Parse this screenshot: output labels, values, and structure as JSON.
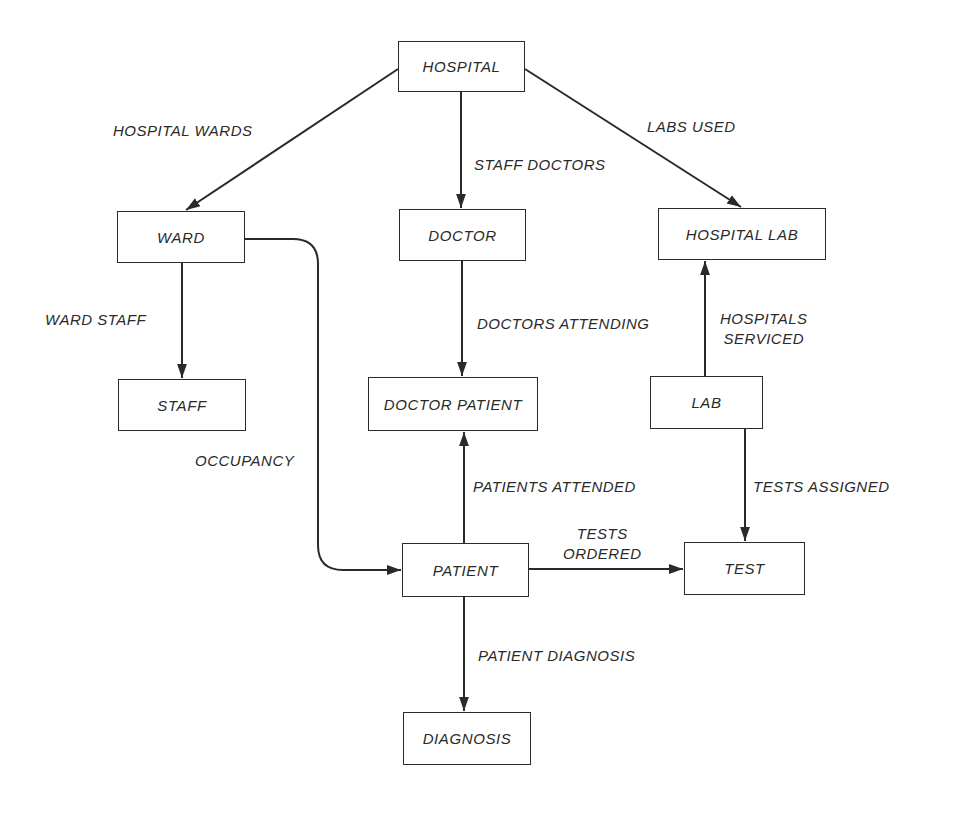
{
  "diagram": {
    "type": "data-structure-diagram",
    "nodes": {
      "hospital": "HOSPITAL",
      "ward": "WARD",
      "doctor": "DOCTOR",
      "hospital_lab": "HOSPITAL LAB",
      "staff": "STAFF",
      "doctor_patient": "DOCTOR PATIENT",
      "lab": "LAB",
      "patient": "PATIENT",
      "test": "TEST",
      "diagnosis": "DIAGNOSIS"
    },
    "edges": {
      "hospital_wards": "HOSPITAL WARDS",
      "staff_doctors": "STAFF DOCTORS",
      "labs_used": "LABS USED",
      "ward_staff": "WARD STAFF",
      "doctors_attending": "DOCTORS ATTENDING",
      "hospitals_serviced_line1": "HOSPITALS",
      "hospitals_serviced_line2": "SERVICED",
      "occupancy": "OCCUPANCY",
      "patients_attended": "PATIENTS ATTENDED",
      "tests_assigned": "TESTS ASSIGNED",
      "tests_ordered_line1": "TESTS",
      "tests_ordered_line2": "ORDERED",
      "patient_diagnosis": "PATIENT DIAGNOSIS"
    },
    "relationships": [
      {
        "from": "HOSPITAL",
        "to": "WARD",
        "label": "HOSPITAL WARDS"
      },
      {
        "from": "HOSPITAL",
        "to": "DOCTOR",
        "label": "STAFF DOCTORS"
      },
      {
        "from": "HOSPITAL",
        "to": "HOSPITAL LAB",
        "label": "LABS USED"
      },
      {
        "from": "WARD",
        "to": "STAFF",
        "label": "WARD STAFF"
      },
      {
        "from": "WARD",
        "to": "PATIENT",
        "label": "OCCUPANCY"
      },
      {
        "from": "DOCTOR",
        "to": "DOCTOR PATIENT",
        "label": "DOCTORS ATTENDING"
      },
      {
        "from": "PATIENT",
        "to": "DOCTOR PATIENT",
        "label": "PATIENTS ATTENDED"
      },
      {
        "from": "LAB",
        "to": "HOSPITAL LAB",
        "label": "HOSPITALS SERVICED"
      },
      {
        "from": "LAB",
        "to": "TEST",
        "label": "TESTS ASSIGNED"
      },
      {
        "from": "PATIENT",
        "to": "TEST",
        "label": "TESTS ORDERED"
      },
      {
        "from": "PATIENT",
        "to": "DIAGNOSIS",
        "label": "PATIENT DIAGNOSIS"
      }
    ],
    "colors": {
      "stroke": "#2a2a2a",
      "background": "#ffffff"
    }
  }
}
